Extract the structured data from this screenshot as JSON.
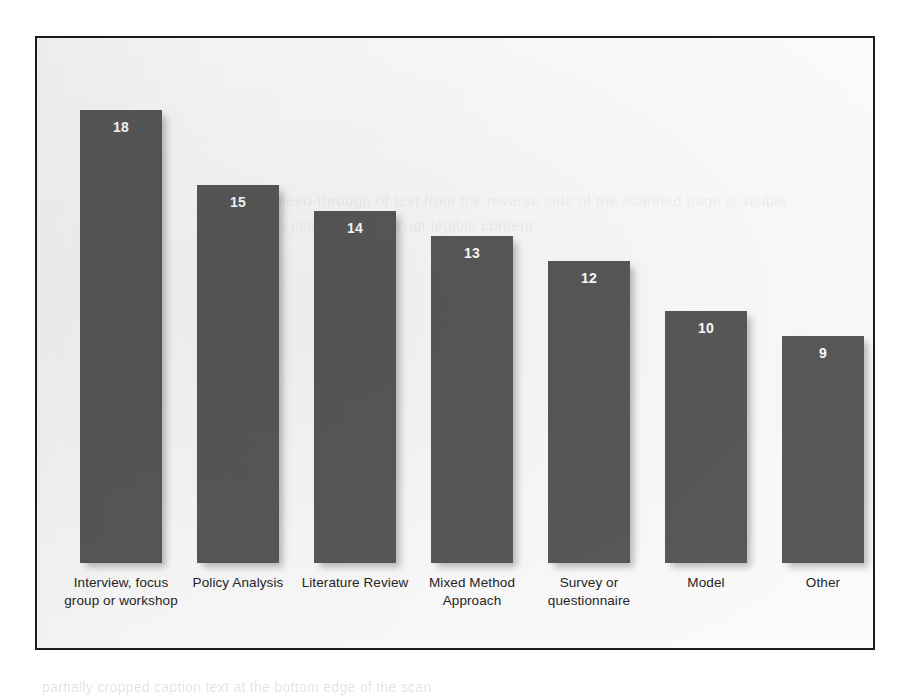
{
  "figure": {
    "border_color": "#1c1c1c",
    "background_color": "#fdfdfd",
    "ghost_text": "the faint bleed-through of text from the reverse side of the scanned page is visible behind the plot area and is not legible content"
  },
  "caption_remnant": "partially cropped caption text at the bottom edge of the scan",
  "chart_data": {
    "type": "bar",
    "title": "",
    "subtitle": "",
    "xlabel": "",
    "ylabel": "",
    "ylim": [
      0,
      20
    ],
    "grid": false,
    "legend": "none",
    "axis_visible": false,
    "data_labels": true,
    "bar_color": "#595959",
    "data_label_color": "#ffffff",
    "categories": [
      "Interview, focus group or workshop",
      "Policy Analysis",
      "Literature Review",
      "Mixed Method Approach",
      "Survey or questionnaire",
      "Model",
      "Other"
    ],
    "values": [
      18,
      15,
      14,
      13,
      12,
      10,
      9
    ],
    "value_labels": [
      "18",
      "15",
      "14",
      "13",
      "12",
      "10",
      "9"
    ]
  }
}
